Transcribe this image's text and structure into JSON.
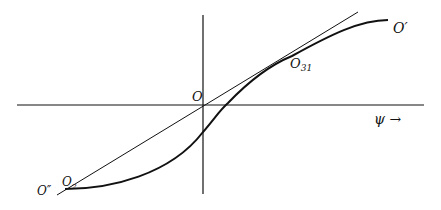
{
  "diagram": {
    "axes": {
      "x_axis_label": "ψ →",
      "origin_label": "O"
    },
    "points": {
      "upper_end": "O′",
      "tangent_point": "O",
      "tangent_point_sub": "31",
      "lower_end": "O″",
      "lower_tangent": "O",
      "lower_tangent_sub": "2"
    },
    "colors": {
      "ink": "#111111",
      "background": "#ffffff"
    }
  }
}
